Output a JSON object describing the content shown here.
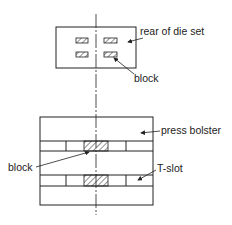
{
  "diagram": {
    "type": "technical-drawing",
    "labels": {
      "rear_of_die_set": "rear of die set",
      "block_top": "block",
      "press_bolster": "press bolster",
      "block_bottom": "block",
      "t_slot": "T-slot"
    },
    "colors": {
      "line": "#222222",
      "background": "#ffffff"
    }
  }
}
